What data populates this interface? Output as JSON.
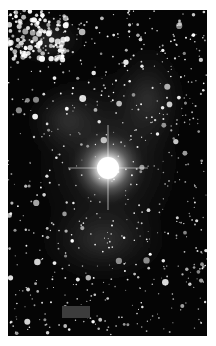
{
  "image": {
    "subject": "star field with bright central star and surrounding nebulosity",
    "description": "Grayscale astronomical image",
    "colors": {
      "background": "#050505",
      "star": "#ffffff",
      "nebula": "#4a4a4a",
      "mask_rect": "#3c3c3c"
    },
    "bright_star": {
      "cx": 100,
      "cy": 158
    },
    "mask_rect": {
      "x": 54,
      "y": 296,
      "w": 28,
      "h": 12
    }
  }
}
